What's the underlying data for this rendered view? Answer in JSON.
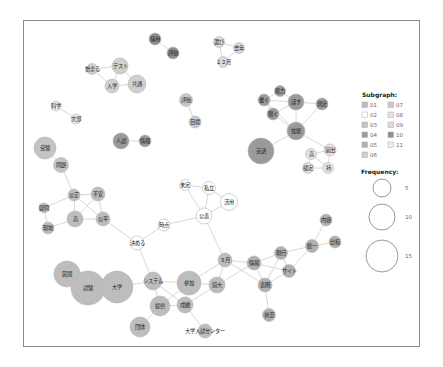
{
  "chart_data": {
    "type": "network",
    "title": "",
    "legend": {
      "subgraph_title": "Subgraph:",
      "subgraphs": [
        {
          "id": "01",
          "color": "#bdbdbd"
        },
        {
          "id": "02",
          "color": "#ffffff"
        },
        {
          "id": "03",
          "color": "#c4c4c4"
        },
        {
          "id": "04",
          "color": "#9a9a9a"
        },
        {
          "id": "05",
          "color": "#b0b0b0"
        },
        {
          "id": "06",
          "color": "#cfcfcf"
        },
        {
          "id": "07",
          "color": "#c9c9c9"
        },
        {
          "id": "08",
          "color": "#e3e3e3"
        },
        {
          "id": "09",
          "color": "#dadada"
        },
        {
          "id": "10",
          "color": "#8f8f8f"
        },
        {
          "id": "11",
          "color": "#ededed"
        }
      ],
      "frequency_title": "Frequency:",
      "frequency": [
        {
          "value": "5",
          "r": 9
        },
        {
          "value": "10",
          "r": 13
        },
        {
          "value": "15",
          "r": 16
        }
      ]
    },
    "nodes": [
      {
        "id": "n1",
        "label": "採用",
        "x": 155,
        "y": 39,
        "r": 6,
        "sg": "10"
      },
      {
        "id": "n2",
        "label": "評価",
        "x": 173,
        "y": 53,
        "r": 6,
        "sg": "10"
      },
      {
        "id": "n3",
        "label": "選び",
        "x": 219,
        "y": 42,
        "r": 5.5,
        "sg": "09"
      },
      {
        "id": "n4",
        "label": "去年",
        "x": 239,
        "y": 48,
        "r": 5.5,
        "sg": "09"
      },
      {
        "id": "n5",
        "label": "１２月",
        "x": 223,
        "y": 62,
        "r": 5.5,
        "sg": "09"
      },
      {
        "id": "n6",
        "label": "始まる",
        "x": 92,
        "y": 69,
        "r": 5.5,
        "sg": "06"
      },
      {
        "id": "n7",
        "label": "テスト",
        "x": 120,
        "y": 66,
        "r": 8,
        "sg": "06"
      },
      {
        "id": "n8",
        "label": "入学",
        "x": 112,
        "y": 86,
        "r": 7,
        "sg": "06"
      },
      {
        "id": "n9",
        "label": "共通",
        "x": 137,
        "y": 84,
        "r": 9,
        "sg": "06"
      },
      {
        "id": "n10",
        "label": "評価",
        "x": 186,
        "y": 100,
        "r": 6.5,
        "sg": "07"
      },
      {
        "id": "n11",
        "label": "目標",
        "x": 195,
        "y": 122,
        "r": 6,
        "sg": "07"
      },
      {
        "id": "n12",
        "label": "科学",
        "x": 56,
        "y": 106,
        "r": 5,
        "sg": "11"
      },
      {
        "id": "n13",
        "label": "文部",
        "x": 76,
        "y": 119,
        "r": 5,
        "sg": "11"
      },
      {
        "id": "n14",
        "label": "人試",
        "x": 121,
        "y": 141,
        "r": 8,
        "sg": "04"
      },
      {
        "id": "n15",
        "label": "情報",
        "x": 145,
        "y": 141,
        "r": 6,
        "sg": "04"
      },
      {
        "id": "n16",
        "label": "受験",
        "x": 45,
        "y": 148,
        "r": 11,
        "sg": "03"
      },
      {
        "id": "n17",
        "label": "問題",
        "x": 61,
        "y": 165,
        "r": 7.5,
        "sg": "03"
      },
      {
        "id": "n18",
        "label": "能力",
        "x": 280,
        "y": 91,
        "r": 5.5,
        "sg": "04"
      },
      {
        "id": "n19",
        "label": "書く",
        "x": 264,
        "y": 100,
        "r": 6,
        "sg": "04"
      },
      {
        "id": "n20",
        "label": "話す",
        "x": 296,
        "y": 102,
        "r": 8,
        "sg": "04"
      },
      {
        "id": "n21",
        "label": "測定",
        "x": 322,
        "y": 104,
        "r": 6,
        "sg": "04"
      },
      {
        "id": "n22",
        "label": "聞く",
        "x": 273,
        "y": 114,
        "r": 6,
        "sg": "04"
      },
      {
        "id": "n23",
        "label": "技能",
        "x": 296,
        "y": 131,
        "r": 9,
        "sg": "04"
      },
      {
        "id": "n24",
        "label": "英語",
        "x": 261,
        "y": 151,
        "r": 13,
        "sg": "04"
      },
      {
        "id": "n25",
        "label": "高",
        "x": 311,
        "y": 154,
        "r": 5.5,
        "sg": "08"
      },
      {
        "id": "n26",
        "label": "富田",
        "x": 330,
        "y": 150,
        "r": 6,
        "sg": "08"
      },
      {
        "id": "n27",
        "label": "検定",
        "x": 308,
        "y": 168,
        "r": 5.5,
        "sg": "08"
      },
      {
        "id": "n28",
        "label": "持",
        "x": 328,
        "y": 168,
        "r": 5.5,
        "sg": "08"
      },
      {
        "id": "n29",
        "label": "公正",
        "x": 74,
        "y": 195,
        "r": 6,
        "sg": "01"
      },
      {
        "id": "n30",
        "label": "不安",
        "x": 98,
        "y": 194,
        "r": 7,
        "sg": "01"
      },
      {
        "id": "n31",
        "label": "疑問",
        "x": 44,
        "y": 208,
        "r": 5,
        "sg": "01"
      },
      {
        "id": "n32",
        "label": "高",
        "x": 75,
        "y": 219,
        "r": 8,
        "sg": "01"
      },
      {
        "id": "n33",
        "label": "公平",
        "x": 103,
        "y": 219,
        "r": 7,
        "sg": "01"
      },
      {
        "id": "n34",
        "label": "現場",
        "x": 48,
        "y": 228,
        "r": 6,
        "sg": "01"
      },
      {
        "id": "n35",
        "label": "未定",
        "x": 185,
        "y": 185,
        "r": 5.5,
        "sg": "02"
      },
      {
        "id": "n36",
        "label": "私立",
        "x": 209,
        "y": 188,
        "r": 6.5,
        "sg": "02"
      },
      {
        "id": "n37",
        "label": "活用",
        "x": 229,
        "y": 202,
        "r": 8.5,
        "sg": "02"
      },
      {
        "id": "n38",
        "label": "公表",
        "x": 204,
        "y": 216,
        "r": 8,
        "sg": "02"
      },
      {
        "id": "n39",
        "label": "時点",
        "x": 164,
        "y": 225,
        "r": 6,
        "sg": "02"
      },
      {
        "id": "n40",
        "label": "決める",
        "x": 137,
        "y": 243,
        "r": 7,
        "sg": "02"
      },
      {
        "id": "n41",
        "label": "内容",
        "x": 326,
        "y": 220,
        "r": 6,
        "sg": "05"
      },
      {
        "id": "n42",
        "label": "比較",
        "x": 335,
        "y": 242,
        "r": 6,
        "sg": "05"
      },
      {
        "id": "n43",
        "label": "統一",
        "x": 312,
        "y": 246,
        "r": 6.5,
        "sg": "05"
      },
      {
        "id": "n44",
        "label": "現行",
        "x": 281,
        "y": 253,
        "r": 6.5,
        "sg": "05"
      },
      {
        "id": "n45",
        "label": "サイト",
        "x": 289,
        "y": 271,
        "r": 6.5,
        "sg": "05"
      },
      {
        "id": "n46",
        "label": "情報",
        "x": 254,
        "y": 263,
        "r": 7,
        "sg": "05"
      },
      {
        "id": "n47",
        "label": "表明",
        "x": 265,
        "y": 285,
        "r": 7,
        "sg": "05"
      },
      {
        "id": "n48",
        "label": "状況",
        "x": 269,
        "y": 315,
        "r": 6.5,
        "sg": "05"
      },
      {
        "id": "n49",
        "label": "９月",
        "x": 225,
        "y": 260,
        "r": 7,
        "sg": "01"
      },
      {
        "id": "n50",
        "label": "民間",
        "x": 67,
        "y": 274,
        "r": 13,
        "sg": "01"
      },
      {
        "id": "n51",
        "label": "試験",
        "x": 88,
        "y": 288,
        "r": 17,
        "sg": "01"
      },
      {
        "id": "n52",
        "label": "大学",
        "x": 117,
        "y": 287,
        "r": 16,
        "sg": "01"
      },
      {
        "id": "n53",
        "label": "システム",
        "x": 153,
        "y": 281,
        "r": 9,
        "sg": "01"
      },
      {
        "id": "n54",
        "label": "参加",
        "x": 189,
        "y": 283,
        "r": 12,
        "sg": "01"
      },
      {
        "id": "n55",
        "label": "短大",
        "x": 217,
        "y": 285,
        "r": 8,
        "sg": "01"
      },
      {
        "id": "n56",
        "label": "成績",
        "x": 185,
        "y": 305,
        "r": 8,
        "sg": "01"
      },
      {
        "id": "n57",
        "label": "提供",
        "x": 160,
        "y": 306,
        "r": 10,
        "sg": "01"
      },
      {
        "id": "n58",
        "label": "団体",
        "x": 140,
        "y": 327,
        "r": 10,
        "sg": "01"
      },
      {
        "id": "n59",
        "label": "大学入試センター",
        "x": 205,
        "y": 331,
        "r": 7,
        "sg": "01"
      }
    ],
    "edges": [
      [
        "n1",
        "n2"
      ],
      [
        "n3",
        "n4"
      ],
      [
        "n3",
        "n5"
      ],
      [
        "n4",
        "n5"
      ],
      [
        "n6",
        "n7"
      ],
      [
        "n6",
        "n8"
      ],
      [
        "n7",
        "n8"
      ],
      [
        "n8",
        "n9"
      ],
      [
        "n7",
        "n9"
      ],
      [
        "n10",
        "n11"
      ],
      [
        "n12",
        "n13"
      ],
      [
        "n14",
        "n15"
      ],
      [
        "n16",
        "n17"
      ],
      [
        "n17",
        "n29"
      ],
      [
        "n18",
        "n19"
      ],
      [
        "n18",
        "n20"
      ],
      [
        "n19",
        "n20"
      ],
      [
        "n19",
        "n22"
      ],
      [
        "n20",
        "n21"
      ],
      [
        "n20",
        "n22"
      ],
      [
        "n20",
        "n23"
      ],
      [
        "n19",
        "n23"
      ],
      [
        "n22",
        "n23"
      ],
      [
        "n21",
        "n23"
      ],
      [
        "n23",
        "n24"
      ],
      [
        "n23",
        "n26"
      ],
      [
        "n25",
        "n26"
      ],
      [
        "n25",
        "n27"
      ],
      [
        "n25",
        "n28"
      ],
      [
        "n26",
        "n28"
      ],
      [
        "n27",
        "n28"
      ],
      [
        "n29",
        "n30"
      ],
      [
        "n29",
        "n31"
      ],
      [
        "n29",
        "n32"
      ],
      [
        "n29",
        "n33"
      ],
      [
        "n30",
        "n32"
      ],
      [
        "n30",
        "n33"
      ],
      [
        "n32",
        "n33"
      ],
      [
        "n32",
        "n34"
      ],
      [
        "n31",
        "n34"
      ],
      [
        "n33",
        "n40"
      ],
      [
        "n35",
        "n36"
      ],
      [
        "n35",
        "n38"
      ],
      [
        "n36",
        "n37"
      ],
      [
        "n36",
        "n38"
      ],
      [
        "n37",
        "n38"
      ],
      [
        "n38",
        "n39"
      ],
      [
        "n39",
        "n40"
      ],
      [
        "n38",
        "n49"
      ],
      [
        "n40",
        "n53"
      ],
      [
        "n41",
        "n43"
      ],
      [
        "n42",
        "n43"
      ],
      [
        "n43",
        "n44"
      ],
      [
        "n43",
        "n45"
      ],
      [
        "n44",
        "n46"
      ],
      [
        "n44",
        "n45"
      ],
      [
        "n44",
        "n47"
      ],
      [
        "n45",
        "n46"
      ],
      [
        "n45",
        "n47"
      ],
      [
        "n46",
        "n47"
      ],
      [
        "n47",
        "n48"
      ],
      [
        "n46",
        "n49"
      ],
      [
        "n46",
        "n55"
      ],
      [
        "n49",
        "n54"
      ],
      [
        "n49",
        "n55"
      ],
      [
        "n49",
        "n47"
      ],
      [
        "n50",
        "n51"
      ],
      [
        "n51",
        "n52"
      ],
      [
        "n52",
        "n53"
      ],
      [
        "n53",
        "n54"
      ],
      [
        "n53",
        "n57"
      ],
      [
        "n53",
        "n56"
      ],
      [
        "n54",
        "n55"
      ],
      [
        "n54",
        "n56"
      ],
      [
        "n54",
        "n57"
      ],
      [
        "n56",
        "n57"
      ],
      [
        "n56",
        "n55"
      ],
      [
        "n57",
        "n58"
      ],
      [
        "n56",
        "n59"
      ]
    ]
  }
}
